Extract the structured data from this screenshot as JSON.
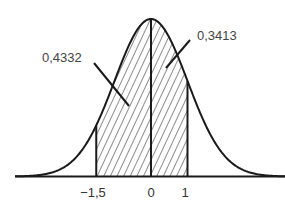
{
  "diagram": {
    "type": "normal-distribution-shaded-area",
    "axis": {
      "ticks": [
        {
          "value": -1.5,
          "label": "−1,5"
        },
        {
          "value": 0,
          "label": "0"
        },
        {
          "value": 1,
          "label": "1"
        }
      ]
    },
    "regions": [
      {
        "from": -1.5,
        "to": 0,
        "area_label": "0,4332"
      },
      {
        "from": 0,
        "to": 1,
        "area_label": "0,3413"
      }
    ],
    "colors": {
      "line": "#1a1a1a",
      "text": "#444444",
      "background": "#ffffff"
    }
  }
}
